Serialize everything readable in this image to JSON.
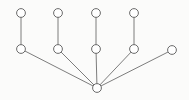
{
  "diagram": {
    "type": "node-link-graph",
    "canvas": {
      "width": 189,
      "height": 100,
      "background": "#fbfbfa"
    },
    "style": {
      "node_fill": "#ffffff",
      "node_stroke": "#5a5a5a",
      "node_radius": 4.4,
      "edge_stroke": "#6e6e6e",
      "edge_width": 0.9
    },
    "nodes": [
      {
        "id": "root",
        "label": "",
        "x": 97,
        "y": 88,
        "role": "root"
      },
      {
        "id": "m1",
        "label": "",
        "x": 21,
        "y": 49,
        "role": "branch"
      },
      {
        "id": "m2",
        "label": "",
        "x": 58,
        "y": 49,
        "role": "branch"
      },
      {
        "id": "m3",
        "label": "",
        "x": 96,
        "y": 49,
        "role": "branch"
      },
      {
        "id": "m4",
        "label": "",
        "x": 134,
        "y": 49,
        "role": "branch"
      },
      {
        "id": "m5",
        "label": "",
        "x": 172,
        "y": 50,
        "role": "leaf"
      },
      {
        "id": "t1",
        "label": "",
        "x": 21,
        "y": 13,
        "role": "leaf"
      },
      {
        "id": "t2",
        "label": "",
        "x": 58,
        "y": 13,
        "role": "leaf"
      },
      {
        "id": "t3",
        "label": "",
        "x": 96,
        "y": 13,
        "role": "leaf"
      },
      {
        "id": "t4",
        "label": "",
        "x": 134,
        "y": 13,
        "role": "leaf"
      }
    ],
    "edges": [
      {
        "id": "e1",
        "source": "root",
        "target": "m1"
      },
      {
        "id": "e2",
        "source": "root",
        "target": "m2"
      },
      {
        "id": "e3",
        "source": "root",
        "target": "m3"
      },
      {
        "id": "e4",
        "source": "root",
        "target": "m4"
      },
      {
        "id": "e5",
        "source": "root",
        "target": "m5"
      },
      {
        "id": "e6",
        "source": "m1",
        "target": "t1"
      },
      {
        "id": "e7",
        "source": "m2",
        "target": "t2"
      },
      {
        "id": "e8",
        "source": "m3",
        "target": "t3"
      },
      {
        "id": "e9",
        "source": "m4",
        "target": "t4"
      }
    ]
  }
}
